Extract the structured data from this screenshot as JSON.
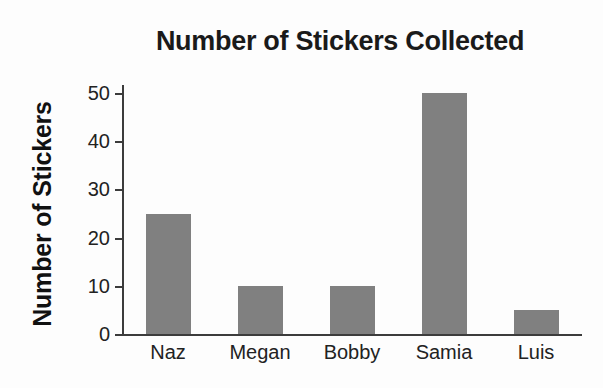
{
  "chart_data": {
    "type": "bar",
    "title": "Number of Stickers Collected",
    "xlabel": "",
    "ylabel": "Number of Stickers",
    "categories": [
      "Naz",
      "Megan",
      "Bobby",
      "Samia",
      "Luis"
    ],
    "values": [
      25,
      10,
      10,
      50,
      5
    ],
    "series": [
      {
        "name": "Number of Stickers",
        "values": [
          25,
          10,
          10,
          50,
          5
        ]
      }
    ],
    "ylim": [
      0,
      50
    ],
    "yticks": [
      0,
      10,
      20,
      30,
      40,
      50
    ],
    "ytick_labels": [
      "0",
      "10",
      "20",
      "30",
      "40",
      "50"
    ],
    "grid": false,
    "legend": false,
    "legend_position": "none",
    "bar_color": "#808080",
    "axis_color": "#3c3c3c",
    "text_color": "#1a1a1a",
    "background_color": "#fdfdfd"
  }
}
